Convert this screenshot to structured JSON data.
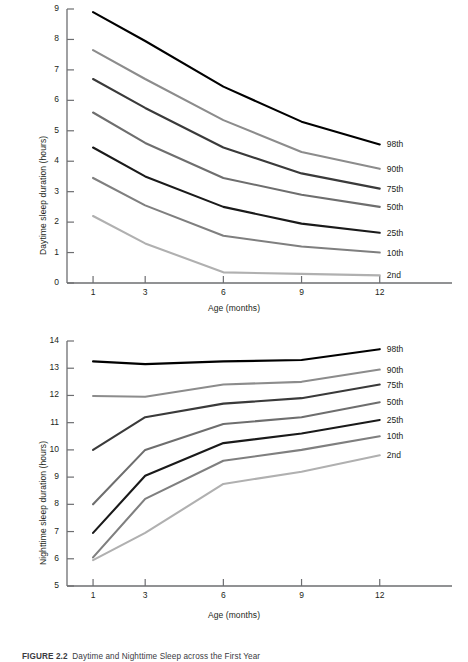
{
  "figure": {
    "caption_label": "FIGURE 2.2",
    "caption_text": "Daytime and Nighttime Sleep across the First Year"
  },
  "charts": [
    {
      "id": "daytime",
      "ylabel": "Daytime sleep duration (hours)",
      "xlabel": "Age (months)"
    },
    {
      "id": "nighttime",
      "ylabel": "Nighttime sleep duration (hours)",
      "xlabel": "Age (months)"
    }
  ],
  "chart_data": [
    {
      "type": "line",
      "title": "Daytime sleep duration across the first year",
      "xlabel": "Age (months)",
      "ylabel": "Daytime sleep duration (hours)",
      "x": [
        1,
        3,
        6,
        9,
        12
      ],
      "xticklabels": [
        "1",
        "3",
        "6",
        "9",
        "12"
      ],
      "xlim": [
        0,
        13.2
      ],
      "ylim": [
        0,
        9
      ],
      "yticks": [
        0,
        1,
        2,
        3,
        4,
        5,
        6,
        7,
        8,
        9
      ],
      "yticklabels": [
        "0",
        "1",
        "2",
        "3",
        "4",
        "5",
        "6",
        "7",
        "8",
        "9"
      ],
      "grid": false,
      "legend_position": "right-of-line-ends",
      "series": [
        {
          "name": "98th",
          "values": [
            8.9,
            7.95,
            6.45,
            5.3,
            4.55
          ],
          "color": "#000000"
        },
        {
          "name": "90th",
          "values": [
            7.65,
            6.7,
            5.35,
            4.3,
            3.75
          ],
          "color": "#8c8c8c"
        },
        {
          "name": "75th",
          "values": [
            6.7,
            5.75,
            4.45,
            3.6,
            3.1
          ],
          "color": "#3a3a3a"
        },
        {
          "name": "50th",
          "values": [
            5.6,
            4.6,
            3.45,
            2.9,
            2.5
          ],
          "color": "#6e6e6e"
        },
        {
          "name": "25th",
          "values": [
            4.45,
            3.5,
            2.5,
            1.95,
            1.65
          ],
          "color": "#1a1a1a"
        },
        {
          "name": "10th",
          "values": [
            3.45,
            2.55,
            1.55,
            1.2,
            1.0
          ],
          "color": "#7f7f7f"
        },
        {
          "name": "2nd",
          "values": [
            2.2,
            1.3,
            0.35,
            0.3,
            0.25
          ],
          "color": "#b0b0b0"
        }
      ]
    },
    {
      "type": "line",
      "title": "Nighttime sleep duration across the first year",
      "xlabel": "Age (months)",
      "ylabel": "Nighttime sleep duration (hours)",
      "x": [
        1,
        3,
        6,
        9,
        12
      ],
      "xticklabels": [
        "1",
        "3",
        "6",
        "9",
        "12"
      ],
      "xlim": [
        0,
        13.2
      ],
      "ylim": [
        5,
        14
      ],
      "yticks": [
        5,
        6,
        7,
        8,
        9,
        10,
        11,
        12,
        13,
        14
      ],
      "yticklabels": [
        "5",
        "6",
        "7",
        "8",
        "9",
        "10",
        "11",
        "12",
        "13",
        "14"
      ],
      "grid": false,
      "legend_position": "right-of-line-ends",
      "series": [
        {
          "name": "98th",
          "values": [
            13.25,
            13.15,
            13.25,
            13.3,
            13.7
          ],
          "color": "#000000"
        },
        {
          "name": "90th",
          "values": [
            11.98,
            11.95,
            12.4,
            12.5,
            12.95
          ],
          "color": "#8c8c8c"
        },
        {
          "name": "75th",
          "values": [
            10.0,
            11.2,
            11.7,
            11.9,
            12.4
          ],
          "color": "#3a3a3a"
        },
        {
          "name": "50th",
          "values": [
            8.0,
            10.0,
            10.95,
            11.2,
            11.75
          ],
          "color": "#6e6e6e"
        },
        {
          "name": "25th",
          "values": [
            6.95,
            9.05,
            10.25,
            10.6,
            11.1
          ],
          "color": "#1a1a1a"
        },
        {
          "name": "10th",
          "values": [
            6.05,
            8.2,
            9.6,
            10.0,
            10.5
          ],
          "color": "#7f7f7f"
        },
        {
          "name": "2nd",
          "values": [
            5.95,
            6.95,
            8.75,
            9.2,
            9.8
          ],
          "color": "#b0b0b0"
        }
      ]
    }
  ]
}
